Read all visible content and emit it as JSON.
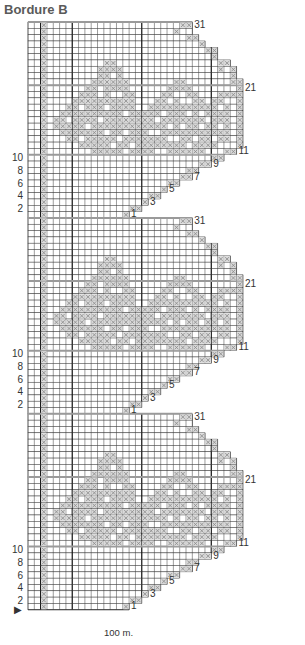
{
  "title": "Bordure B",
  "caption": "100 m.",
  "grid": {
    "origin_x": 28,
    "origin_y": 22,
    "cell": 6.32,
    "cols": 34,
    "rows": 94,
    "thick_cols": [
      2,
      7,
      18,
      29
    ],
    "line_color": "#3a3a3a",
    "thick_color": "#111111",
    "band_color": "#9a9a9a",
    "stitch_color": "#8a8a8a"
  },
  "left_labels": [
    {
      "row_from_bottom": 2,
      "text": "2"
    },
    {
      "row_from_bottom": 4,
      "text": "4"
    },
    {
      "row_from_bottom": 6,
      "text": "6"
    },
    {
      "row_from_bottom": 8,
      "text": "8"
    },
    {
      "row_from_bottom": 10,
      "text": "10"
    },
    {
      "row_from_bottom": 33,
      "text": "2"
    },
    {
      "row_from_bottom": 35,
      "text": "4"
    },
    {
      "row_from_bottom": 37,
      "text": "6"
    },
    {
      "row_from_bottom": 39,
      "text": "8"
    },
    {
      "row_from_bottom": 41,
      "text": "10"
    },
    {
      "row_from_bottom": 64,
      "text": "2"
    },
    {
      "row_from_bottom": 66,
      "text": "4"
    },
    {
      "row_from_bottom": 68,
      "text": "6"
    },
    {
      "row_from_bottom": 70,
      "text": "8"
    },
    {
      "row_from_bottom": 72,
      "text": "10"
    }
  ],
  "right_labels": [
    "1",
    "3",
    "5",
    "7",
    "9",
    "11",
    "21",
    "31"
  ],
  "start_marker": "▶",
  "chart_data": {
    "type": "table",
    "title": "Bordure B",
    "repeat_rows": 31,
    "repeats": 3,
    "row_labels_right": [
      1,
      3,
      5,
      7,
      9,
      11,
      21,
      31
    ],
    "row_labels_left": [
      2,
      4,
      6,
      8,
      10
    ],
    "footer": "100 m."
  },
  "repeat": [
    "..X.....................XX",
    "..X....................X..",
    "..X......................XX",
    "..X........................X",
    "..X.........................XX",
    "..X..........................X",
    "..X.........XX................XX",
    "..X........XXXX...............X.X",
    "..X........XX.X.................X",
    "..X.......XXXXXX.......XX.......XX",
    "..X......XX.XXXX......XXXX.......X",
    "..X.....XXX.X..XX....XX..XX...XXXX",
    "..X....XXXXXXXXXX...XX.X..XX.XX..X",
    "..X...XX.XXX.XXXX..XXXXXXXXXXX.X.X",
    "..X..XXXXXXXXXX.XXXXX.XXX.X.XXXX.X",
    "..X.XX.XXXX.XXXXXXXX.XXXXXXX.XXX.X",
    "..X.XXXXX.XXXXXXXXXXXX.X.XX.XX.X.X",
    "..X..XXXXXXX.XX.XXX..XXXXXXXXXXX.X",
    "..X...XX.XXXXX.XXXXXXX..XX.XX.XX.X",
    "..X.....XXXXX.XX.XXXXXXXX.XXXX...X",
    "..X.......XXXXX.XXXX..XXXXXX...XX",
    "..X..........................XX",
    "..X........................XX",
    "..X......................XX",
    "..X.....................XX",
    "..X...................XX",
    "..X..................X",
    "..X................XX",
    "..X...............X",
    "..X.............XX",
    "..X............X"
  ]
}
